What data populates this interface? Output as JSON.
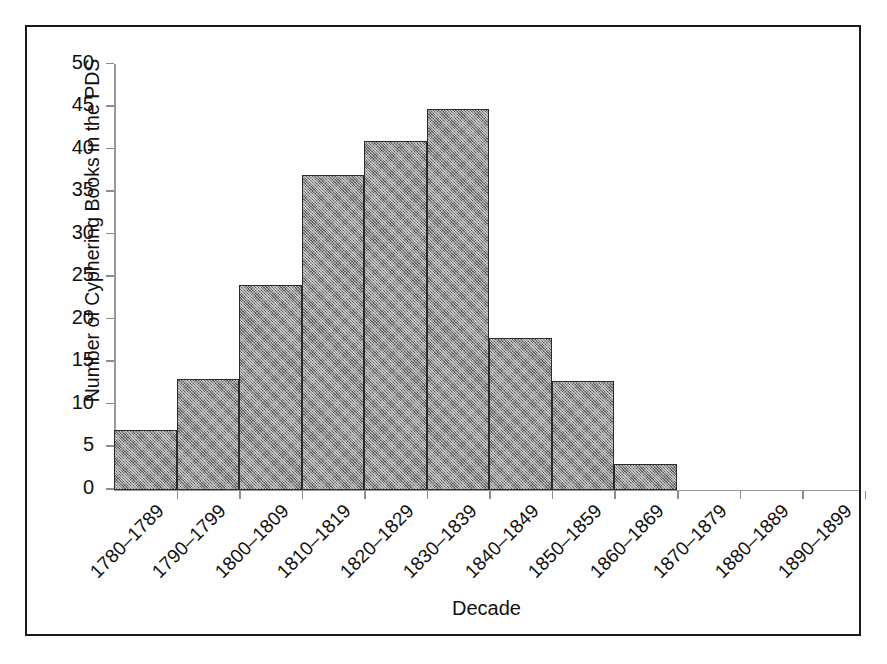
{
  "chart_data": {
    "type": "bar",
    "title": "",
    "xlabel": "Decade",
    "ylabel": "Number of Cyphering Books in the PDS",
    "categories": [
      "1780–1789",
      "1790–1799",
      "1800–1809",
      "1810–1819",
      "1820–1829",
      "1830–1839",
      "1840–1849",
      "1850–1859",
      "1860–1869",
      "1870–1879",
      "1880–1889",
      "1890–1899"
    ],
    "values": [
      7,
      13,
      24,
      37,
      41,
      44.7,
      17.8,
      12.7,
      3,
      0,
      0,
      0
    ],
    "ylim": [
      0,
      50
    ],
    "ytick_labels": [
      "0",
      "5",
      "10",
      "15",
      "20",
      "25",
      "30",
      "35",
      "40",
      "45",
      "50"
    ],
    "ytick_values": [
      0,
      5,
      10,
      15,
      20,
      25,
      30,
      35,
      40,
      45,
      50
    ],
    "grid": false,
    "legend": false,
    "bar_fill_color": "#8f8f8f",
    "bar_edge_color": "#2b2b2b",
    "axis_color": "#9a9a9a",
    "text_color": "#111111",
    "frame_color": "#1a1a1a"
  }
}
